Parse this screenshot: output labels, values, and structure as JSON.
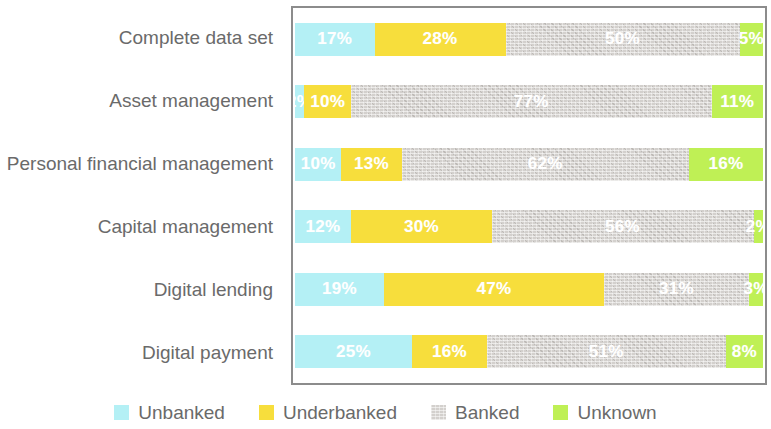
{
  "chart_data": {
    "type": "bar",
    "title": "",
    "subtitle": "",
    "xlabel": "",
    "ylabel": "",
    "stacked": true,
    "orientation": "horizontal",
    "grid": false,
    "xlim": [
      0,
      100
    ],
    "axis_unit": "%",
    "legend_position": "bottom",
    "categories": [
      "Complete data set",
      "Asset management",
      "Personal financial management",
      "Capital management",
      "Digital lending",
      "Digital payment"
    ],
    "series": [
      {
        "name": "Unbanked",
        "color": "#b4f0f5",
        "values": [
          17,
          2,
          10,
          12,
          19,
          25
        ]
      },
      {
        "name": "Underbanked",
        "color": "#f7de3c",
        "values": [
          28,
          10,
          13,
          30,
          47,
          16
        ]
      },
      {
        "name": "Banked",
        "color": "#d3d0cd",
        "values": [
          50,
          77,
          62,
          56,
          31,
          51
        ]
      },
      {
        "name": "Unknown",
        "color": "#bff055",
        "values": [
          5,
          11,
          16,
          2,
          3,
          8
        ]
      }
    ],
    "data_labels": [
      [
        "17%",
        "28%",
        "50%",
        "5%"
      ],
      [
        "2%",
        "10%",
        "77%",
        "11%"
      ],
      [
        "10%",
        "13%",
        "62%",
        "16%"
      ],
      [
        "12%",
        "30%",
        "56%",
        "2%"
      ],
      [
        "19%",
        "47%",
        "31%",
        "3%"
      ],
      [
        "25%",
        "16%",
        "51%",
        "8%"
      ]
    ]
  },
  "legend": {
    "items": [
      {
        "label": "Unbanked",
        "color": "#b4f0f5"
      },
      {
        "label": "Underbanked",
        "color": "#f7de3c"
      },
      {
        "label": "Banked",
        "color": "#d3d0cd"
      },
      {
        "label": "Unknown",
        "color": "#bff055"
      }
    ]
  }
}
